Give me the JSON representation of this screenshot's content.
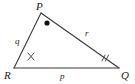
{
  "figure": {
    "type": "triangle-diagram",
    "stroke_color": "#3a3a3a",
    "label_color": "#1a1a1a",
    "background_color": "#ffffff",
    "vertices": [
      {
        "name": "P",
        "label": "P",
        "x": 41,
        "y": 13
      },
      {
        "name": "R",
        "label": "R",
        "x": 14,
        "y": 68
      },
      {
        "name": "Q",
        "label": "Q",
        "x": 119,
        "y": 68
      }
    ],
    "sides": [
      {
        "name": "side-q",
        "label": "q",
        "from": "R",
        "to": "P"
      },
      {
        "name": "side-r",
        "label": "r",
        "from": "P",
        "to": "Q"
      },
      {
        "name": "side-p",
        "label": "p",
        "from": "R",
        "to": "Q"
      }
    ],
    "angle_marks": [
      {
        "name": "angle-P",
        "vertex": "P",
        "mark": "dot"
      },
      {
        "name": "angle-R",
        "vertex": "R",
        "mark": "x"
      },
      {
        "name": "angle-Q",
        "vertex": "Q",
        "mark": "double-tick"
      }
    ]
  }
}
